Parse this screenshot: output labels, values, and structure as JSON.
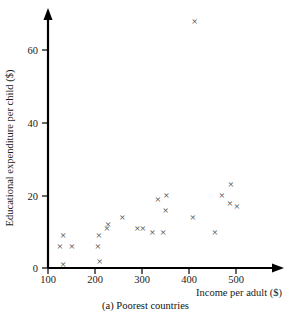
{
  "figure": {
    "caption": "(a)  Poorest countries",
    "caption_parts": {
      "label": "(a)",
      "text": "Poorest countries"
    }
  },
  "chart_data": {
    "type": "scatter",
    "title": "",
    "subtitle": "",
    "xlabel": "Income per adult ($)",
    "ylabel": "Educational expenditure per child ($)",
    "xlim": [
      100,
      540
    ],
    "ylim": [
      0,
      70
    ],
    "xticks": [
      100,
      200,
      300,
      400,
      500
    ],
    "yticks": [
      0,
      20,
      40,
      60
    ],
    "xtick_labels": [
      "100",
      "200",
      "300",
      "400",
      "500"
    ],
    "ytick_labels": [
      "0",
      "20",
      "40",
      "60"
    ],
    "grid": false,
    "legend": null,
    "marker": "x",
    "marker_color": "#3c3c3c",
    "axis_color": "#000000",
    "background": "#ffffff",
    "annotations": [],
    "n_points": 23,
    "points": [
      {
        "x": 132,
        "y": 9
      },
      {
        "x": 125,
        "y": 6
      },
      {
        "x": 151,
        "y": 6
      },
      {
        "x": 132,
        "y": 1
      },
      {
        "x": 206,
        "y": 6
      },
      {
        "x": 210,
        "y": 2
      },
      {
        "x": 208,
        "y": 9
      },
      {
        "x": 225,
        "y": 11
      },
      {
        "x": 228,
        "y": 12
      },
      {
        "x": 258,
        "y": 14
      },
      {
        "x": 290,
        "y": 11
      },
      {
        "x": 302,
        "y": 11
      },
      {
        "x": 322,
        "y": 10
      },
      {
        "x": 334,
        "y": 19
      },
      {
        "x": 352,
        "y": 20
      },
      {
        "x": 350,
        "y": 16
      },
      {
        "x": 345,
        "y": 10
      },
      {
        "x": 412,
        "y": 68
      },
      {
        "x": 408,
        "y": 14
      },
      {
        "x": 455,
        "y": 10
      },
      {
        "x": 470,
        "y": 20
      },
      {
        "x": 489,
        "y": 23
      },
      {
        "x": 487,
        "y": 18
      },
      {
        "x": 502,
        "y": 17
      }
    ]
  }
}
